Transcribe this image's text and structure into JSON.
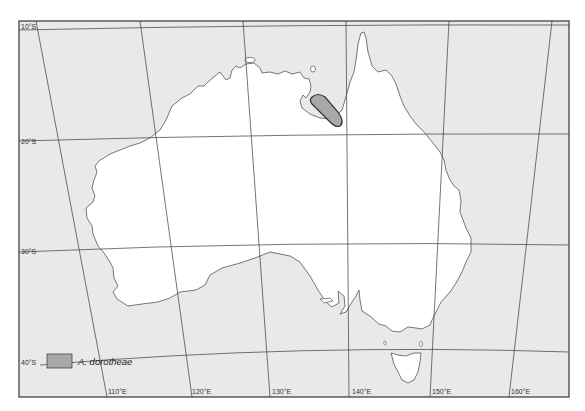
{
  "map": {
    "title": "Distribution map",
    "colors": {
      "ocean": "#e9e9e9",
      "land": "#ffffff",
      "coast": "#555555",
      "graticule": "#3a3a3a",
      "frame": "#444444",
      "range_fill": "#a8a8a8",
      "range_stroke": "#333333"
    },
    "latitude_labels": [
      "10°S",
      "20°S",
      "30°S",
      "40°S"
    ],
    "longitude_labels": [
      "110°E",
      "120°E",
      "130°E",
      "140°E",
      "150°E",
      "160°E"
    ]
  },
  "legend": {
    "species": "A. dorotheae",
    "swatch_color": "#a8a8a8"
  }
}
